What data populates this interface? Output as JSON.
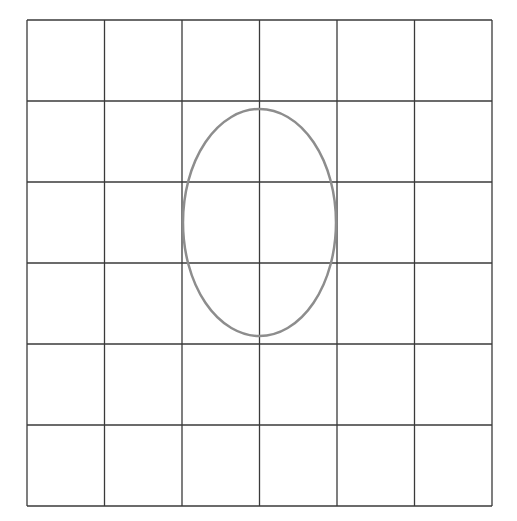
{
  "figure": {
    "background_color": "#ffffff",
    "grid": {
      "rows": 6,
      "columns": 6,
      "x": 27,
      "y": 20,
      "width": 465,
      "height": 486,
      "line_color": "#3a3a3a",
      "line_width": 1.3
    },
    "ellipse": {
      "cx": 259.5,
      "cy": 222.5,
      "rx": 76.5,
      "ry": 113.5,
      "stroke_color": "#8d8d8d",
      "stroke_width": 2.5,
      "fill": "none"
    }
  }
}
